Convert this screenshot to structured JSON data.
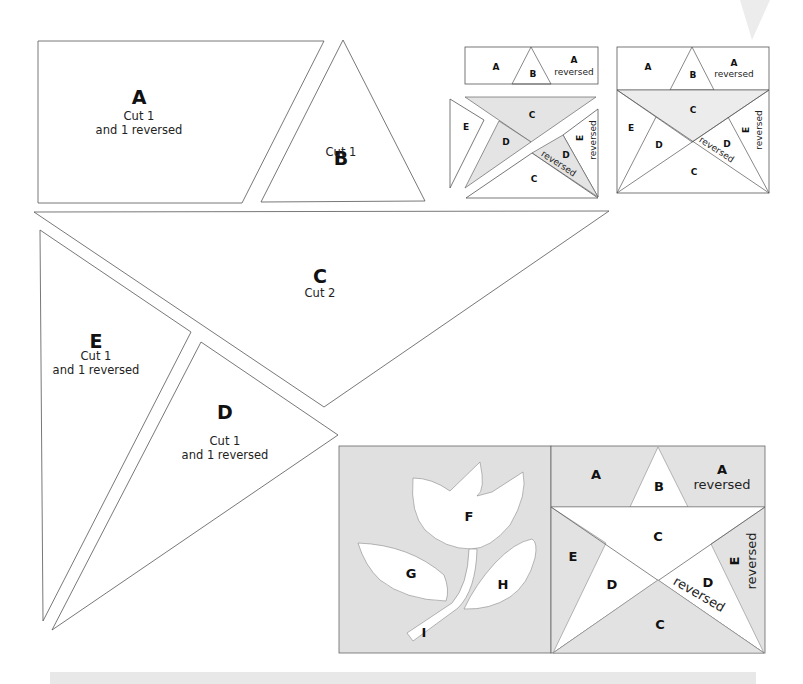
{
  "templates": {
    "A": {
      "letter": "A",
      "line1": "Cut 1",
      "line2": "and 1 reversed"
    },
    "B": {
      "letter": "B",
      "line1": "Cut 1"
    },
    "C": {
      "letter": "C",
      "line1": "Cut 2"
    },
    "D": {
      "letter": "D",
      "line1": "Cut 1",
      "line2": "and 1 reversed"
    },
    "E": {
      "letter": "E",
      "line1": "Cut 1",
      "line2": "and 1 reversed"
    }
  },
  "assembly_small": {
    "top_row": {
      "a": "A",
      "b": "B",
      "a_rev": "A",
      "a_rev_sub": "reversed"
    },
    "exploded": {
      "e": "E",
      "c_top": "C",
      "d": "D",
      "d_rev": "D",
      "d_rev_sub": "reversed",
      "e_rev": "E",
      "e_rev_sub": "reversed",
      "c_bottom": "C"
    }
  },
  "assembly_block": {
    "a": "A",
    "b": "B",
    "a_rev": "A",
    "a_rev_sub": "reversed",
    "c_top": "C",
    "e": "E",
    "d": "D",
    "d_rev": "D",
    "d_rev_sub": "reversed",
    "e_rev": "E",
    "e_rev_sub": "reversed",
    "c_bottom": "C"
  },
  "tulip_block": {
    "f": "F",
    "g": "G",
    "h": "H",
    "i": "I"
  },
  "star_block": {
    "a": "A",
    "b": "B",
    "a_rev": "A",
    "a_rev_sub": "reversed",
    "c_top": "C",
    "e": "E",
    "d": "D",
    "d_rev": "D",
    "d_rev_sub": "reversed",
    "e_rev": "E",
    "e_rev_sub": "reversed",
    "c_bottom": "C"
  },
  "colors": {
    "outline": "#555555",
    "shade": "#e4e4e4",
    "caption_band": "#e8e8e8"
  }
}
